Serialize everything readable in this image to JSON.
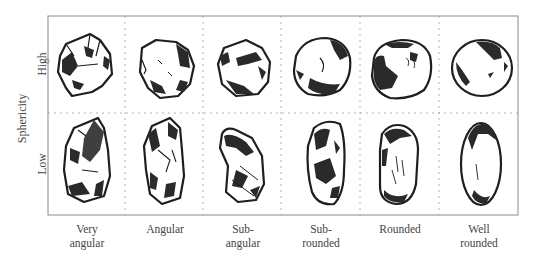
{
  "diagram": {
    "y_axis_title": "Sphericity",
    "rows": [
      {
        "id": "high",
        "label": "High"
      },
      {
        "id": "low",
        "label": "Low"
      }
    ],
    "columns": [
      {
        "id": "very-angular",
        "line1": "Very",
        "line2": "angular"
      },
      {
        "id": "angular",
        "line1": "Angular",
        "line2": ""
      },
      {
        "id": "sub-angular",
        "line1": "Sub-",
        "line2": "angular"
      },
      {
        "id": "sub-rounded",
        "line1": "Sub-",
        "line2": "rounded"
      },
      {
        "id": "rounded",
        "line1": "Rounded",
        "line2": ""
      },
      {
        "id": "well-rounded",
        "line1": "Well",
        "line2": "rounded"
      }
    ],
    "colors": {
      "frame": "#8a8a8a",
      "divider": "#a0a0a0",
      "grain_outline": "#1e1e1e",
      "grain_shadow": "#2a2a2a",
      "text": "#444444"
    }
  }
}
